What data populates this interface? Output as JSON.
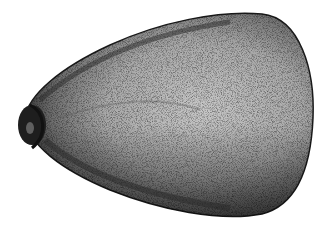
{
  "image": {
    "subject": "stippled illustration of an egg-shaped seed / fruit pit",
    "style": "pen-and-ink stipple",
    "colors": {
      "background": "#ffffff",
      "ink": "#1a1a1a",
      "light_tone": "#bdbdbd",
      "mid_tone": "#7a7a7a",
      "dark_tone": "#2a2a2a"
    }
  }
}
